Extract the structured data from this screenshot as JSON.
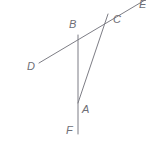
{
  "figure": {
    "type": "geometry-diagram",
    "width": 146,
    "height": 144,
    "background_color": "#ffffff",
    "stroke_color": "#7d7d85",
    "label_color": "#6e6e76",
    "stroke_width": 1,
    "points": {
      "A": {
        "label": "A",
        "x": 78,
        "y": 103,
        "label_x": 82,
        "label_y": 104
      },
      "B": {
        "label": "B",
        "x": 78,
        "y": 35,
        "label_x": 69,
        "label_y": 19
      },
      "C": {
        "label": "C",
        "x": 108,
        "y": 14,
        "label_x": 113,
        "label_y": 14
      },
      "D": {
        "label": "D",
        "x": 39,
        "y": 63,
        "label_x": 27,
        "label_y": 61
      },
      "E": {
        "label": "E",
        "x": 145,
        "y": 0,
        "label_x": 139,
        "label_y": -1
      },
      "F": {
        "label": "F",
        "x": 78,
        "y": 134,
        "label_x": 66,
        "label_y": 125
      }
    },
    "segments": [
      {
        "name": "line-D-to-E",
        "from": "D",
        "to": "E"
      },
      {
        "name": "line-B-to-F",
        "from": "B",
        "to": "F"
      },
      {
        "name": "segment-C-to-A",
        "from": "C",
        "to": "A"
      }
    ]
  }
}
